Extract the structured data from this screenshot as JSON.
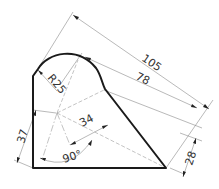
{
  "drawing": {
    "type": "technical-drawing",
    "colors": {
      "outline": "#1a1a1a",
      "dimension": "#8a8a8a",
      "text": "#333333"
    },
    "dimensions": {
      "overall_length": "105",
      "inner_length": "78",
      "radius": "R25",
      "left_offset": "37",
      "center_offset": "34",
      "angle": "90°",
      "right_height": "28"
    }
  }
}
